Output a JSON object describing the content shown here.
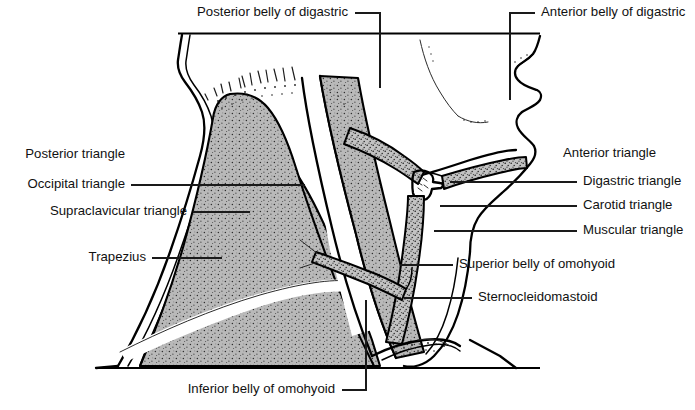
{
  "figure": {
    "background_color": "#ffffff",
    "line_color": "#000000",
    "muscle_fill_color": "#b8b8b8",
    "text_color": "#111111"
  },
  "labels": {
    "top": [
      {
        "id": "posterior-belly-of-digastric",
        "text": "Posterior belly of digastric",
        "side": "top-left",
        "text_x": 348,
        "text_y": 13,
        "anchor": "end"
      },
      {
        "id": "anterior-belly-of-digastric",
        "text": "Anterior belly of digastric",
        "side": "top-right",
        "text_x": 541,
        "text_y": 13,
        "anchor": "start"
      }
    ],
    "left": [
      {
        "id": "posterior-triangle",
        "text": "Posterior triangle",
        "text_x": 125,
        "text_y": 155,
        "anchor": "end",
        "has_leader": false
      },
      {
        "id": "occipital-triangle",
        "text": "Occipital triangle",
        "text_x": 125,
        "text_y": 185,
        "anchor": "end",
        "has_leader": true
      },
      {
        "id": "supraclavicular-triangle",
        "text": "Supraclavicular triangle",
        "text_x": 187,
        "text_y": 212,
        "anchor": "end",
        "has_leader": true
      },
      {
        "id": "trapezius",
        "text": "Trapezius",
        "text_x": 146,
        "text_y": 258,
        "anchor": "end",
        "has_leader": true
      }
    ],
    "right": [
      {
        "id": "anterior-triangle",
        "text": "Anterior triangle",
        "text_x": 563,
        "text_y": 154,
        "anchor": "start",
        "has_leader": false
      },
      {
        "id": "digastric-triangle",
        "text": "Digastric triangle",
        "text_x": 583,
        "text_y": 182,
        "anchor": "start",
        "has_leader": true
      },
      {
        "id": "carotid-triangle",
        "text": "Carotid triangle",
        "text_x": 583,
        "text_y": 206,
        "anchor": "start",
        "has_leader": true
      },
      {
        "id": "muscular-triangle",
        "text": "Muscular triangle",
        "text_x": 583,
        "text_y": 231,
        "anchor": "start",
        "has_leader": true
      },
      {
        "id": "superior-belly-of-omohyoid",
        "text": "Superior belly of omohyoid",
        "text_x": 459,
        "text_y": 265,
        "anchor": "start",
        "has_leader": true
      },
      {
        "id": "sternocleidomastoid",
        "text": "Sternocleidomastoid",
        "text_x": 478,
        "text_y": 298,
        "anchor": "start",
        "has_leader": true
      }
    ],
    "bottom": [
      {
        "id": "inferior-belly-of-omohyoid",
        "text": "Inferior belly of omohyoid",
        "text_x": 335,
        "text_y": 397,
        "anchor": "end",
        "has_leader": true
      }
    ]
  }
}
